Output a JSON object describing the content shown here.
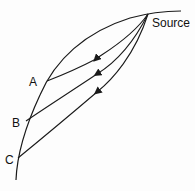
{
  "diagram": {
    "labels": {
      "source": "Source",
      "a": "A",
      "b": "B",
      "c": "C"
    },
    "colors": {
      "stroke": "#1a1a1a",
      "background": "#fdfdfd"
    },
    "nodes": [
      {
        "id": "source",
        "x": 148,
        "y": 14
      },
      {
        "id": "a",
        "x": 47,
        "y": 81
      },
      {
        "id": "b",
        "x": 26,
        "y": 121
      },
      {
        "id": "c",
        "x": 18,
        "y": 158
      }
    ],
    "edges": [
      {
        "from": "source",
        "to": "a",
        "arrow": true
      },
      {
        "from": "source",
        "to": "b",
        "arrow": true
      },
      {
        "from": "source",
        "to": "c",
        "arrow": true
      }
    ]
  }
}
